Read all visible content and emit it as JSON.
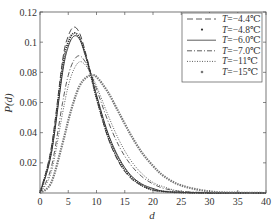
{
  "chart_data": {
    "type": "line",
    "title": "",
    "xlabel": "d",
    "ylabel": "P(d)",
    "xlim": [
      0,
      40
    ],
    "ylim": [
      0,
      0.12
    ],
    "xticks": [
      0,
      5,
      10,
      15,
      20,
      25,
      30,
      35,
      40
    ],
    "yticks": [
      0.02,
      0.04,
      0.06,
      0.08,
      0.1,
      0.12
    ],
    "ytick_labels": [
      "0.02",
      "0.04",
      "0.06",
      "0.08",
      "0.1",
      "0.12"
    ],
    "grid": false,
    "legend_position": "upper right",
    "x": [
      0,
      2,
      4,
      5,
      6,
      7,
      8,
      9,
      10,
      12,
      14,
      16,
      18,
      20,
      22,
      25,
      30,
      35,
      40
    ],
    "series": [
      {
        "name": "T=-4.4℃",
        "style": "dashed",
        "peak_d": 6.0,
        "peak_value": 0.11,
        "values": [
          0,
          0.03,
          0.088,
          0.104,
          0.11,
          0.106,
          0.094,
          0.079,
          0.063,
          0.037,
          0.02,
          0.01,
          0.005,
          0.002,
          0.001,
          0.0003,
          0,
          0,
          0
        ]
      },
      {
        "name": "T=-4.8℃",
        "style": "dots",
        "peak_d": 6.0,
        "peak_value": 0.106,
        "values": [
          0,
          0.028,
          0.084,
          0.1,
          0.106,
          0.103,
          0.092,
          0.078,
          0.063,
          0.038,
          0.021,
          0.011,
          0.005,
          0.002,
          0.001,
          0.0003,
          0,
          0,
          0
        ]
      },
      {
        "name": "T=-6.0℃",
        "style": "solid",
        "peak_d": 6.2,
        "peak_value": 0.104,
        "values": [
          0,
          0.026,
          0.08,
          0.097,
          0.104,
          0.102,
          0.092,
          0.079,
          0.065,
          0.04,
          0.023,
          0.012,
          0.006,
          0.003,
          0.001,
          0.0004,
          0,
          0,
          0
        ]
      },
      {
        "name": "T=-7.0℃",
        "style": "dashdot",
        "peak_d": 7.0,
        "peak_value": 0.091,
        "values": [
          0,
          0.017,
          0.06,
          0.078,
          0.088,
          0.091,
          0.087,
          0.079,
          0.069,
          0.048,
          0.031,
          0.019,
          0.011,
          0.006,
          0.003,
          0.001,
          0.0002,
          0,
          0
        ]
      },
      {
        "name": "T=-11℃",
        "style": "dotted",
        "peak_d": 7.5,
        "peak_value": 0.087,
        "values": [
          0,
          0.014,
          0.053,
          0.071,
          0.082,
          0.087,
          0.085,
          0.079,
          0.071,
          0.052,
          0.035,
          0.022,
          0.013,
          0.007,
          0.004,
          0.001,
          0.0003,
          0,
          0
        ]
      },
      {
        "name": "T=-15℃",
        "style": "markers",
        "peak_d": 9.0,
        "peak_value": 0.078,
        "values": [
          0,
          0.007,
          0.033,
          0.048,
          0.061,
          0.071,
          0.076,
          0.078,
          0.077,
          0.067,
          0.053,
          0.039,
          0.027,
          0.018,
          0.011,
          0.005,
          0.001,
          0.0002,
          0
        ]
      }
    ]
  },
  "legend": {
    "items": [
      {
        "prefix": "T",
        "rest": "=−4.4℃"
      },
      {
        "prefix": "T",
        "rest": "=−4.8℃"
      },
      {
        "prefix": "T",
        "rest": "=−6.0℃"
      },
      {
        "prefix": "T",
        "rest": "=−7.0℃"
      },
      {
        "prefix": "T",
        "rest": "=−11℃"
      },
      {
        "prefix": "T",
        "rest": "=−15℃"
      }
    ]
  },
  "colors": {
    "curve": "#333333",
    "axis": "#555555",
    "marker": "#666666"
  }
}
